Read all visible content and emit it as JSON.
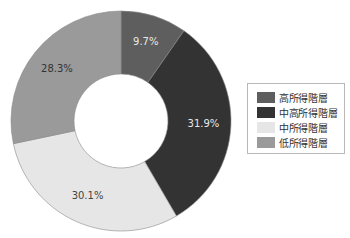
{
  "chart_data": {
    "type": "pie",
    "variant": "donut",
    "title": "",
    "categories": [
      "高所得階層",
      "中高所得階層",
      "中所得階層",
      "低所得階層"
    ],
    "values": [
      9.7,
      31.9,
      30.1,
      28.3
    ],
    "labels": [
      "9.7%",
      "31.9%",
      "30.1%",
      "28.3%"
    ],
    "colors": [
      "#5e5e5e",
      "#333333",
      "#e6e6e6",
      "#9a9a9a"
    ],
    "label_colors": [
      "#e8e8e8",
      "#e8e8e8",
      "#444444",
      "#333333"
    ],
    "start_angle_deg": 0,
    "direction": "clockwise",
    "legend_position": "right"
  },
  "legend": {
    "items": [
      {
        "label": "高所得階層",
        "color": "#5e5e5e"
      },
      {
        "label": "中高所得階層",
        "color": "#333333"
      },
      {
        "label": "中所得階層",
        "color": "#e6e6e6"
      },
      {
        "label": "低所得階層",
        "color": "#9a9a9a"
      }
    ]
  }
}
